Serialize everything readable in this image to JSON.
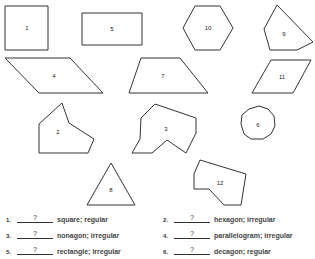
{
  "shapes": [
    {
      "label": "1",
      "points": "5,6 48,6 48,50 5,50",
      "lx": 27,
      "ly": 28
    },
    {
      "label": "5",
      "points": "82,13 142,13 142,45 82,45",
      "lx": 112,
      "ly": 29
    },
    {
      "label": "10",
      "points": "183,28 195,6 220,6 233,28 220,50 195,50",
      "lx": 208,
      "ly": 28
    },
    {
      "label": "9",
      "points": "277,5 313,42 297,50 270,50 264,29",
      "lx": 284,
      "ly": 34
    },
    {
      "label": "4",
      "points": "5,58 70,58 103,93 39,93",
      "lx": 54,
      "ly": 76
    },
    {
      "label": "7",
      "points": "141,58 180,58 208,93 129,93",
      "lx": 163,
      "ly": 76
    },
    {
      "label": "11",
      "points": "271,60 311,60 293,93 252,93",
      "lx": 282,
      "ly": 77
    },
    {
      "label": "2",
      "points": "62,103 69,123 94,139 88,153 39,153 39,124",
      "lx": 58,
      "ly": 132
    },
    {
      "label": "3",
      "points": "155,104 196,118 196,133 186,153 167,140 152,153 132,153 140,139 141,118",
      "lx": 166,
      "ly": 129
    },
    {
      "label": "6",
      "points": "249,109 259,106 268,109 274,116 275,126 271,134 263,139 251,139 244,134 241,124 242,115",
      "lx": 258,
      "ly": 125
    },
    {
      "label": "8",
      "points": "111,163 135,205 87,205",
      "lx": 111,
      "ly": 190
    },
    {
      "label": "12",
      "points": "200,160 246,174 241,205 224,205 209,189 194,189 194,174",
      "lx": 220,
      "ly": 183
    }
  ],
  "questions": [
    {
      "num": "1.",
      "answer": "?",
      "desc": "square; regular"
    },
    {
      "num": "2.",
      "answer": "?",
      "desc": "hexagon; irregular"
    },
    {
      "num": "3.",
      "answer": "?",
      "desc": "nonagon; irregular"
    },
    {
      "num": "4.",
      "answer": "?",
      "desc": "parallelogram; irregular"
    },
    {
      "num": "5.",
      "answer": "?",
      "desc": "rectangle; irregular"
    },
    {
      "num": "6.",
      "answer": "?",
      "desc": "decagon; regular"
    }
  ]
}
